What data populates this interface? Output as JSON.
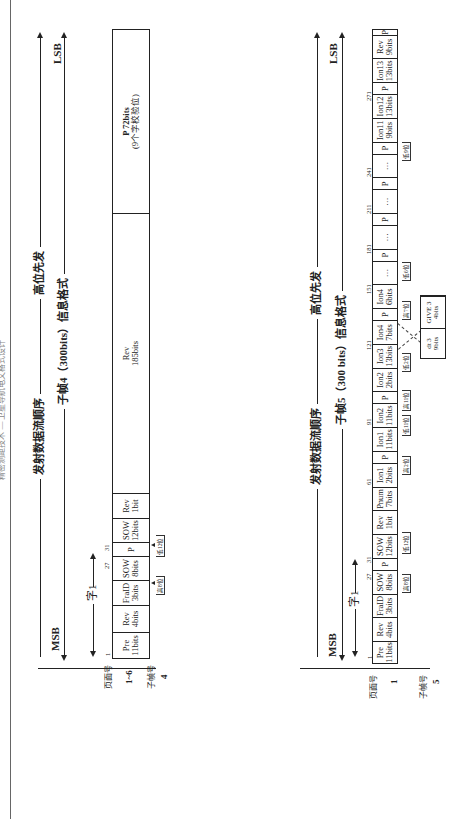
{
  "header": {
    "running_title": "精密测距技术 — 卫星导航电文格式设计"
  },
  "diagram4": {
    "msb": "MSB",
    "lsb": "LSB",
    "stream_label": "发射数据流顺序",
    "msb_first": "高位先发",
    "frame_label": "子帧4（300bits）信息格式",
    "word1": "字1",
    "col_subframe": "子帧号",
    "col_page": "页面号",
    "subframe_no": "4",
    "page_no": "1~6",
    "ticks": {
      "t1": "1",
      "t27": "27",
      "t31": "31"
    },
    "cells": [
      {
        "name": "Pre",
        "bits": "11bits"
      },
      {
        "name": "Rev",
        "bits": "4bits"
      },
      {
        "name": "FraID",
        "bits": "3bits"
      },
      {
        "name": "SOW",
        "bits": "8bits"
      },
      {
        "name": "P",
        "bits": ""
      },
      {
        "name": "SOW",
        "bits": "12bits"
      },
      {
        "name": "Rev",
        "bits": "1bit"
      },
      {
        "name": "Rev",
        "bits": "185bits"
      },
      {
        "name": "P 72bits",
        "bits": "(9个字校验位)"
      }
    ],
    "annotations": {
      "a1": "高8位",
      "a2": "低12位"
    }
  },
  "diagram5": {
    "msb": "MSB",
    "lsb": "LSB",
    "stream_label": "发射数据流顺序",
    "msb_first": "高位先发",
    "frame_label": "子帧5（300 bits）信息格式",
    "word1": "字1",
    "col_subframe": "子帧号",
    "col_page": "页面号",
    "subframe_no": "5",
    "page_no": "1",
    "ticks": {
      "t1": "1",
      "t27": "27",
      "t31": "31",
      "t61": "61",
      "t91": "91",
      "t121": "121",
      "t151": "151",
      "t181": "181",
      "t211": "211",
      "t241": "241",
      "t271": "271"
    },
    "cells": [
      {
        "name": "Pre",
        "bits": "11bits"
      },
      {
        "name": "Rev",
        "bits": "4bits"
      },
      {
        "name": "FraID",
        "bits": "3bits"
      },
      {
        "name": "SOW",
        "bits": "8bits"
      },
      {
        "name": "P",
        "bits": ""
      },
      {
        "name": "SOW",
        "bits": "12bits"
      },
      {
        "name": "Rev",
        "bits": "1bit"
      },
      {
        "name": "Pnum",
        "bits": "7bits"
      },
      {
        "name": "Ion1",
        "bits": "2bits"
      },
      {
        "name": "P",
        "bits": ""
      },
      {
        "name": "Ion1",
        "bits": "11bits"
      },
      {
        "name": "Ion2",
        "bits": "11bits"
      },
      {
        "name": "P",
        "bits": ""
      },
      {
        "name": "Ion2",
        "bits": "2bits"
      },
      {
        "name": "Ion3",
        "bits": "13bits"
      },
      {
        "name": "Ion4",
        "bits": "7bits"
      },
      {
        "name": "P",
        "bits": ""
      },
      {
        "name": "Ion4",
        "bits": "6bits"
      },
      {
        "name": "…",
        "bits": ""
      },
      {
        "name": "P",
        "bits": ""
      },
      {
        "name": "…",
        "bits": ""
      },
      {
        "name": "P",
        "bits": ""
      },
      {
        "name": "…",
        "bits": ""
      },
      {
        "name": "P",
        "bits": ""
      },
      {
        "name": "…",
        "bits": ""
      },
      {
        "name": "P",
        "bits": ""
      },
      {
        "name": "Ion11",
        "bits": "9bits"
      },
      {
        "name": "Ion12",
        "bits": "13bits"
      },
      {
        "name": "P",
        "bits": ""
      },
      {
        "name": "Ion13",
        "bits": "13bits"
      },
      {
        "name": "Rev",
        "bits": "9bits"
      },
      {
        "name": "P",
        "bits": ""
      }
    ],
    "detail": [
      {
        "name": "dt 3",
        "bits": "9bits"
      },
      {
        "name": "GIVE 3",
        "bits": "4bits"
      }
    ],
    "annotations": {
      "a1": "高8位",
      "a2": "低12位",
      "a3": "高2位",
      "a4": "低11位",
      "a5": "高11位",
      "a6": "低2位",
      "a7": "高7位",
      "a8": "低6位",
      "a9": "低9位"
    }
  }
}
